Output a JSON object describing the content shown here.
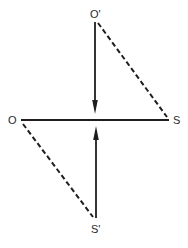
{
  "diagram": {
    "labels": {
      "o": "O",
      "s": "S",
      "o_prime": "O'",
      "s_prime": "S'"
    },
    "colors": {
      "stroke": "#1e1e1e",
      "background": "#ffffff"
    },
    "elements": [
      {
        "id": "os-line",
        "type": "solid-line",
        "from": "O",
        "to": "S"
      },
      {
        "id": "o-prime-arrow",
        "type": "arrow",
        "from": "O'",
        "to": "OS midpoint (from above)"
      },
      {
        "id": "s-prime-arrow",
        "type": "arrow",
        "from": "S'",
        "to": "OS midpoint (from below)"
      },
      {
        "id": "o-prime-s-dashed",
        "type": "dashed-line",
        "from": "O'",
        "to": "S"
      },
      {
        "id": "o-s-prime-dashed",
        "type": "dashed-line",
        "from": "O",
        "to": "S'"
      }
    ]
  }
}
